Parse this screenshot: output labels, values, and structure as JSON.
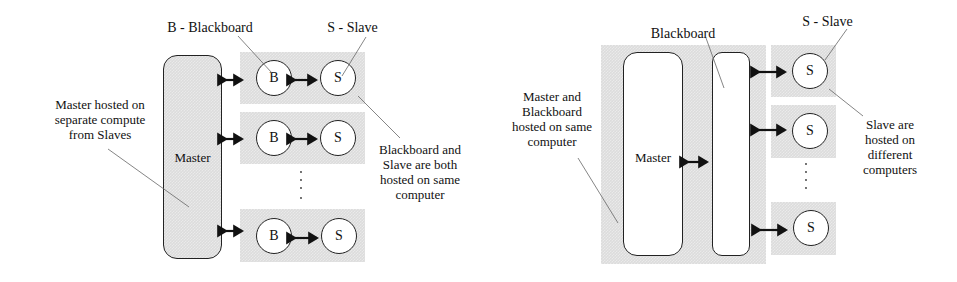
{
  "left_diagram": {
    "legend_blackboard": "B - Blackboard",
    "legend_slave": "S - Slave",
    "master_label": "Master",
    "node_b": "B",
    "node_s": "S",
    "note_master": [
      "Master hosted on",
      "separate compute",
      "from Slaves"
    ],
    "note_pair": [
      "Blackboard and",
      "Slave are both",
      "hosted on same",
      "computer"
    ]
  },
  "right_diagram": {
    "legend_blackboard": "Blackboard",
    "legend_slave": "S - Slave",
    "master_label": "Master",
    "node_s": "S",
    "note_master": [
      "Master and",
      "Blackboard",
      "hosted on same",
      "computer"
    ],
    "note_slaves": [
      "Slave are",
      "hosted on",
      "different",
      "computers"
    ]
  }
}
